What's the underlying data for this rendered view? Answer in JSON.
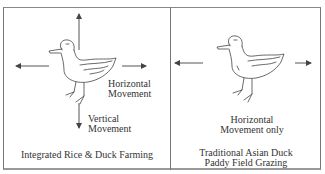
{
  "figure": {
    "panels": [
      {
        "id": "integrated",
        "caption": "Integrated Rice & Duck Farming",
        "labels": {
          "horizontal_line1": "Horizontal",
          "horizontal_line2": "Movement",
          "vertical_line1": "Vertical",
          "vertical_line2": "Movement"
        },
        "arrows": [
          "up",
          "down",
          "left",
          "right"
        ]
      },
      {
        "id": "traditional",
        "caption_line1": "Traditional Asian Duck",
        "caption_line2": "Paddy Field Grazing",
        "labels": {
          "horizontal_line1": "Horizontal",
          "horizontal_line2": "Movement only"
        },
        "arrows": [
          "left",
          "right"
        ]
      }
    ],
    "colors": {
      "line": "#555555",
      "border": "#777777",
      "text": "#333333"
    }
  }
}
